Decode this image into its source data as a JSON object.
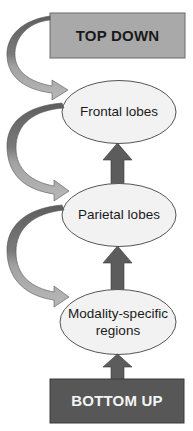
{
  "diagram": {
    "type": "hierarchical-flow",
    "top_box": {
      "label": "TOP DOWN",
      "fill": "#a9a9a9"
    },
    "bottom_box": {
      "label": "BOTTOM UP",
      "fill": "#575757"
    },
    "nodes": [
      {
        "id": "frontal",
        "label": "Frontal lobes"
      },
      {
        "id": "parietal",
        "label": "Parietal lobes"
      },
      {
        "id": "modality",
        "label": "Modality-specific regions"
      }
    ],
    "edges": [
      {
        "from": "BOTTOM UP",
        "to": "Modality-specific regions",
        "style": "straight-up-arrow"
      },
      {
        "from": "Modality-specific regions",
        "to": "Parietal lobes",
        "style": "straight-up-arrow"
      },
      {
        "from": "Parietal lobes",
        "to": "Frontal lobes",
        "style": "straight-up-arrow"
      },
      {
        "from": "TOP DOWN",
        "to": "Frontal lobes",
        "style": "curved-left-arrow"
      },
      {
        "from": "Frontal lobes",
        "to": "Parietal lobes",
        "style": "curved-left-arrow"
      },
      {
        "from": "Parietal lobes",
        "to": "Modality-specific regions",
        "style": "curved-left-arrow"
      }
    ],
    "colors": {
      "ellipse_fill": "#f2f2f2",
      "ellipse_stroke": "#555555",
      "vertical_arrow": "#5c5c5c",
      "curved_arrow_dark": "#5e5e5e",
      "curved_arrow_light": "#b4b4b4"
    }
  }
}
